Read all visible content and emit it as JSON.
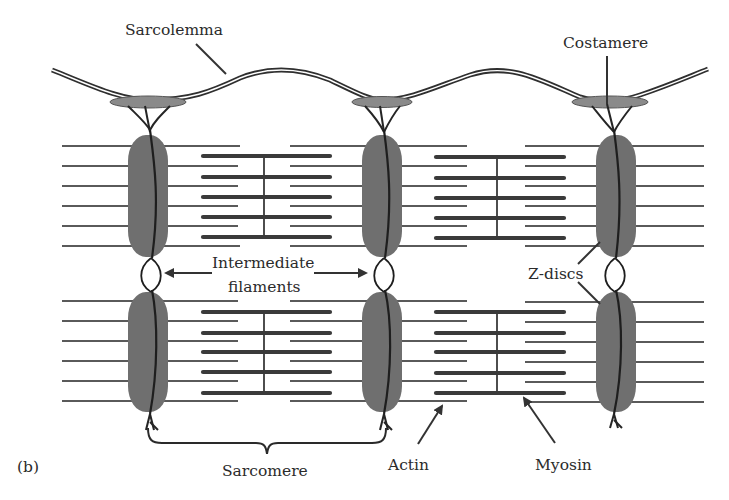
{
  "figure": {
    "panel_label": "(b)",
    "labels": {
      "sarcolemma": "Sarcolemma",
      "costamere": "Costamere",
      "intermediate_line1": "Intermediate",
      "intermediate_line2": "filaments",
      "z_discs": "Z-discs",
      "sarcomere": "Sarcomere",
      "actin": "Actin",
      "myosin": "Myosin"
    },
    "colors": {
      "background": "#ffffff",
      "z_disc_fill": "#6f6f6f",
      "filament": "#3a3a3a",
      "text": "#2b2b2b"
    }
  }
}
